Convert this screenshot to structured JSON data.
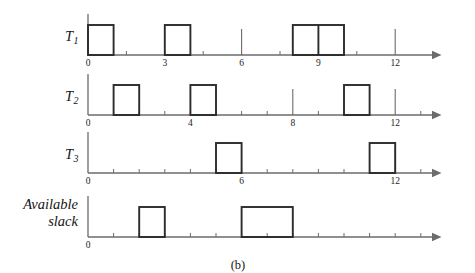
{
  "figure": {
    "caption": "(b)",
    "caption_x": 238,
    "caption_y": 258,
    "background": "#ffffff",
    "axis_color": "#6b6b6b",
    "box_color": "#2b2b2b",
    "text_color": "#141414"
  },
  "geometry": {
    "axis_x_start": 88,
    "axis_x_end": 432,
    "unit_px": 25.6,
    "bar_height": 30,
    "arrow_size": 5
  },
  "rows": [
    {
      "id": "t1",
      "label": "T",
      "subscript": "1",
      "label_line2": "",
      "label_x": 78,
      "label_y": 28,
      "baseline_y": 55,
      "origin_tick_top": 14,
      "tick_step": 1.5,
      "tick_max": 13.4,
      "minor_tick_len": 4,
      "major_tick_len": 26,
      "major_tick_units": [
        6,
        12
      ],
      "tick_labels": [
        {
          "value": 0,
          "text": "0"
        },
        {
          "value": 3,
          "text": "3"
        },
        {
          "value": 6,
          "text": "6"
        },
        {
          "value": 9,
          "text": "9"
        },
        {
          "value": 12,
          "text": "12"
        }
      ],
      "bars": [
        {
          "start": 0,
          "end": 1,
          "divider": null
        },
        {
          "start": 3,
          "end": 4,
          "divider": null
        },
        {
          "start": 8,
          "end": 10,
          "divider": 9
        }
      ]
    },
    {
      "id": "t2",
      "label": "T",
      "subscript": "2",
      "label_line2": "",
      "label_x": 78,
      "label_y": 88,
      "baseline_y": 115,
      "origin_tick_top": 74,
      "tick_step": 1.0,
      "tick_max": 13.4,
      "minor_tick_len": 4,
      "major_tick_len": 26,
      "major_tick_units": [
        8,
        12
      ],
      "tick_labels": [
        {
          "value": 0,
          "text": "0"
        },
        {
          "value": 4,
          "text": "4"
        },
        {
          "value": 8,
          "text": "8"
        },
        {
          "value": 12,
          "text": "12"
        }
      ],
      "bars": [
        {
          "start": 1,
          "end": 2,
          "divider": null
        },
        {
          "start": 4,
          "end": 5,
          "divider": null
        },
        {
          "start": 10,
          "end": 11,
          "divider": null
        }
      ]
    },
    {
      "id": "t3",
      "label": "T",
      "subscript": "3",
      "label_line2": "",
      "label_x": 78,
      "label_y": 146,
      "baseline_y": 173,
      "origin_tick_top": 132,
      "tick_step": 1.0,
      "tick_max": 13.4,
      "minor_tick_len": 4,
      "major_tick_len": 26,
      "major_tick_units": [
        12
      ],
      "tick_labels": [
        {
          "value": 0,
          "text": "0"
        },
        {
          "value": 6,
          "text": "6"
        },
        {
          "value": 12,
          "text": "12"
        }
      ],
      "bars": [
        {
          "start": 5,
          "end": 6,
          "divider": null
        },
        {
          "start": 11,
          "end": 12,
          "divider": null
        }
      ]
    },
    {
      "id": "slack",
      "label": "Available",
      "subscript": "",
      "label_line2": "slack",
      "label_x": 78,
      "label_y": 196,
      "baseline_y": 237,
      "origin_tick_top": 196,
      "tick_step": 1.0,
      "tick_max": 13.4,
      "minor_tick_len": 4,
      "major_tick_len": 0,
      "major_tick_units": [],
      "tick_labels": [
        {
          "value": 0,
          "text": "0"
        }
      ],
      "bars": [
        {
          "start": 2,
          "end": 3,
          "divider": null
        },
        {
          "start": 6,
          "end": 8,
          "divider": null
        }
      ]
    }
  ]
}
